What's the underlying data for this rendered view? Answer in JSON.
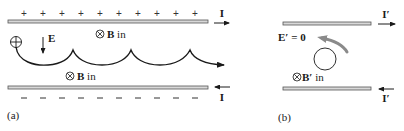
{
  "panel_a": {
    "label": "(a)",
    "top_plate_charge": "+",
    "bottom_plate_charge": "−",
    "top_current": "I",
    "bottom_current": "I",
    "electric_field_label": "E",
    "charge_symbol": "+",
    "b_field_upper": {
      "symbol": "⊗",
      "label": "B",
      "suffix": " in"
    },
    "b_field_lower": {
      "symbol": "⊗",
      "label": "B",
      "suffix": " in"
    }
  },
  "panel_b": {
    "label": "(b)",
    "top_current": "I′",
    "bottom_current": "I′",
    "electric_field_label": "E′ = 0",
    "b_field": {
      "symbol": "⊗",
      "label": "B′",
      "suffix": " in"
    }
  },
  "colors": {
    "plate_fill": "#d8d8d8",
    "plate_stroke": "#555555",
    "ink": "#1a1a1a",
    "rotation_arrow": "#8a8a8a"
  }
}
